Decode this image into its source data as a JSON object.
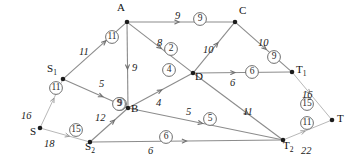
{
  "diagram": {
    "colors": {
      "edge": "#8c8c8c",
      "edge_faint": "#b8b8b8",
      "node": "#1c1c1c",
      "text": "#1a1a1a",
      "circle_stroke": "#6f6f6f",
      "background": "#ffffff"
    },
    "nodes": [
      {
        "id": "S",
        "label": "S",
        "sub": "",
        "x": 40,
        "y": 128,
        "label_dx": -10,
        "label_dy": 4
      },
      {
        "id": "S1",
        "label": "S",
        "sub": "1",
        "x": 63,
        "y": 79,
        "label_dx": -16,
        "label_dy": -10
      },
      {
        "id": "S2",
        "label": "S",
        "sub": "2",
        "x": 90,
        "y": 142,
        "label_dx": -5,
        "label_dy": 5
      },
      {
        "id": "A",
        "label": "A",
        "sub": "",
        "x": 127,
        "y": 22,
        "label_dx": -10,
        "label_dy": -14
      },
      {
        "id": "B",
        "label": "B",
        "sub": "",
        "x": 128,
        "y": 108,
        "label_dx": 3,
        "label_dy": 1
      },
      {
        "id": "C",
        "label": "C",
        "sub": "",
        "x": 235,
        "y": 22,
        "label_dx": 4,
        "label_dy": -11
      },
      {
        "id": "D",
        "label": "D",
        "sub": "",
        "x": 193,
        "y": 73,
        "label_dx": 2,
        "label_dy": 4
      },
      {
        "id": "T1",
        "label": "T",
        "sub": "1",
        "x": 292,
        "y": 72,
        "label_dx": 4,
        "label_dy": -2
      },
      {
        "id": "T2",
        "label": "T",
        "sub": "2",
        "x": 283,
        "y": 140,
        "label_dx": 0,
        "label_dy": 6
      },
      {
        "id": "T",
        "label": "T",
        "sub": "",
        "x": 332,
        "y": 120,
        "label_dx": 5,
        "label_dy": -1
      }
    ],
    "edges": [
      {
        "from": "S",
        "to": "S1",
        "capacity": "16",
        "flow": "11",
        "cap_x": 21,
        "cap_y": 111,
        "flow_x": 56,
        "flow_y": 88,
        "faint": true,
        "arrow_t": 0.62
      },
      {
        "from": "S",
        "to": "S2",
        "capacity": "18",
        "flow": "15",
        "cap_x": 44,
        "cap_y": 139,
        "flow_x": 76,
        "flow_y": 130,
        "faint": true,
        "arrow_t": 0.6
      },
      {
        "from": "S1",
        "to": "A",
        "capacity": "11",
        "flow": "11",
        "cap_x": 79,
        "cap_y": 47,
        "flow_x": 112,
        "flow_y": 37,
        "faint": false,
        "arrow_t": 0.68
      },
      {
        "from": "S1",
        "to": "B",
        "capacity": "5",
        "flow": "9",
        "cap_x": 99,
        "cap_y": 79,
        "flow_x": 120,
        "flow_y": 104,
        "faint": false,
        "arrow_t": 0.62
      },
      {
        "from": "S2",
        "to": "B",
        "capacity": "12",
        "flow": "9",
        "cap_x": 95,
        "cap_y": 113,
        "flow_x": 119,
        "flow_y": 104,
        "faint": false,
        "arrow_t": 0.66
      },
      {
        "from": "S2",
        "to": "T2",
        "capacity": "6",
        "flow": "6",
        "cap_x": 148,
        "cap_y": 146,
        "flow_x": 166,
        "flow_y": 137,
        "faint": false,
        "arrow_t": 0.5
      },
      {
        "from": "A",
        "to": "C",
        "capacity": "9",
        "flow": "9",
        "cap_x": 175,
        "cap_y": 11,
        "flow_x": 200,
        "flow_y": 19,
        "faint": false,
        "arrow_t": 0.48
      },
      {
        "from": "A",
        "to": "D",
        "capacity": "8",
        "flow": "2",
        "cap_x": 157,
        "cap_y": 38,
        "flow_x": 171,
        "flow_y": 49,
        "faint": false,
        "arrow_t": 0.52
      },
      {
        "from": "A",
        "to": "B",
        "capacity": "9",
        "flow": "",
        "cap_x": 132,
        "cap_y": 63,
        "flow_x": 0,
        "flow_y": 0,
        "faint": false,
        "arrow_t": 0.55
      },
      {
        "from": "B",
        "to": "D",
        "capacity": "4",
        "flow": "4",
        "cap_x": 156,
        "cap_y": 98,
        "flow_x": 169,
        "flow_y": 70,
        "faint": false,
        "arrow_t": 0.52
      },
      {
        "from": "B",
        "to": "T2",
        "capacity": "5",
        "flow": "5",
        "cap_x": 186,
        "cap_y": 107,
        "flow_x": 210,
        "flow_y": 119,
        "faint": false,
        "arrow_t": 0.48
      },
      {
        "from": "D",
        "to": "C",
        "capacity": "10",
        "flow": "",
        "cap_x": 203,
        "cap_y": 45,
        "flow_x": 0,
        "flow_y": 0,
        "faint": false,
        "arrow_t": 0.6
      },
      {
        "from": "D",
        "to": "T1",
        "capacity": "6",
        "flow": "6",
        "cap_x": 230,
        "cap_y": 78,
        "flow_x": 252,
        "flow_y": 72,
        "faint": false,
        "arrow_t": 0.42
      },
      {
        "from": "D",
        "to": "T2",
        "capacity": "11",
        "flow": "",
        "cap_x": 243,
        "cap_y": 107,
        "flow_x": 0,
        "flow_y": 0,
        "faint": false,
        "arrow_t": 0.62
      },
      {
        "from": "C",
        "to": "T1",
        "capacity": "10",
        "flow": "9",
        "cap_x": 258,
        "cap_y": 38,
        "flow_x": 274,
        "flow_y": 57,
        "faint": false,
        "arrow_t": 0.55
      },
      {
        "from": "T1",
        "to": "T",
        "capacity": "16",
        "flow": "15",
        "cap_x": 302,
        "cap_y": 90,
        "flow_x": 307,
        "flow_y": 104,
        "faint": true,
        "arrow_t": 0.45
      },
      {
        "from": "T2",
        "to": "T",
        "capacity": "22",
        "flow": "11",
        "cap_x": 301,
        "cap_y": 146,
        "flow_x": 307,
        "flow_y": 123,
        "faint": true,
        "arrow_t": 0.45
      }
    ]
  }
}
